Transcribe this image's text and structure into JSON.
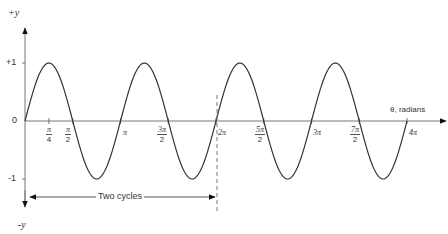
{
  "diagram": {
    "y_axis": {
      "top_label": "+y",
      "bottom_label": "-y",
      "ticks": [
        {
          "label": "+1",
          "value": 1
        },
        {
          "label": "0",
          "value": 0
        },
        {
          "label": "-1",
          "value": -1
        }
      ]
    },
    "x_axis": {
      "label": "θ, radians",
      "ticks": [
        {
          "num": "π",
          "den": "4",
          "value_pi": 0.25
        },
        {
          "num": "π",
          "den": "2",
          "value_pi": 0.5
        },
        {
          "text": "π",
          "value_pi": 1
        },
        {
          "num": "3π",
          "den": "2",
          "value_pi": 1.5
        },
        {
          "text": "2π",
          "value_pi": 2
        },
        {
          "num": "5π",
          "den": "2",
          "value_pi": 2.5
        },
        {
          "text": "3π",
          "value_pi": 3
        },
        {
          "num": "7π",
          "den": "2",
          "value_pi": 3.5
        },
        {
          "text": "4π",
          "value_pi": 4
        }
      ]
    },
    "annotation": {
      "label": "Two cycles",
      "from_pi": 0,
      "to_pi": 2
    },
    "curve": {
      "function": "y = sin(2θ)",
      "domain_pi": [
        0,
        4
      ],
      "amplitude": 1,
      "color": "#333333"
    }
  }
}
